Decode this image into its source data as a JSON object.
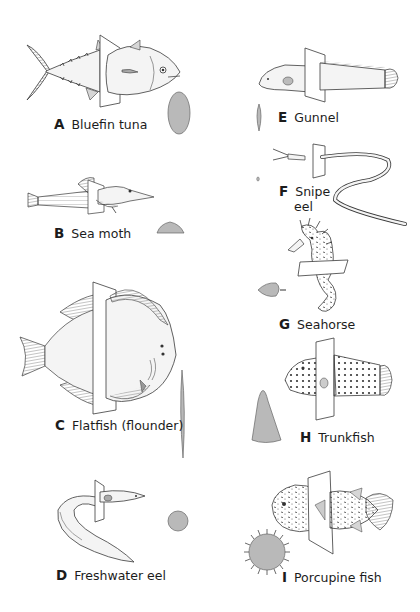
{
  "figure": {
    "colors": {
      "outline": "#3a3a3a",
      "section_fill": "#b9b9b9",
      "body_fill": "#f4f4f4",
      "fin_fill": "#d6d6d6",
      "background": "#ffffff"
    },
    "panels": [
      {
        "letter": "A",
        "name": "Bluefin tuna",
        "cross_section": "tall oval"
      },
      {
        "letter": "B",
        "name": "Sea moth",
        "cross_section": "flat wide dome"
      },
      {
        "letter": "C",
        "name": "Flatfish (flounder)",
        "cross_section": "very thin tall spindle"
      },
      {
        "letter": "D",
        "name": "Freshwater eel",
        "cross_section": "circle"
      },
      {
        "letter": "E",
        "name": "Gunnel",
        "cross_section": "narrow tall oval"
      },
      {
        "letter": "F",
        "name_line1": "Snipe",
        "name_line2": "eel",
        "cross_section": "tiny oval"
      },
      {
        "letter": "G",
        "name": "Seahorse",
        "cross_section": "diamond with tail"
      },
      {
        "letter": "H",
        "name": "Trunkfish",
        "cross_section": "triangle"
      },
      {
        "letter": "I",
        "name": "Porcupine fish",
        "cross_section": "spiny circle"
      }
    ]
  }
}
